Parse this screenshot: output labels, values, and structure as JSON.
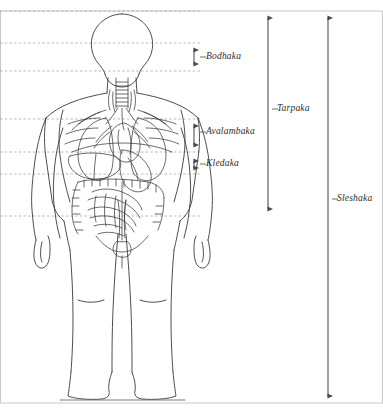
{
  "figure": {
    "colors": {
      "outline": "#3a3a3a",
      "guide_line": "#9a9a9a",
      "arrow": "#4a4a4a",
      "border": "#c8c8c8",
      "label_text": "#2b2b2b",
      "background": "#ffffff"
    }
  },
  "labels": {
    "bodhaka": "Bodhaka",
    "avalambaka": "Avalambaka",
    "kledaka": "Kledaka",
    "tarpaka": "Tarpaka",
    "sleshaka": "Sleshaka"
  },
  "measures": [
    {
      "name": "bodhaka",
      "label": "Bodhaka",
      "top": 43,
      "bottom": 71,
      "axis_x": 194
    },
    {
      "name": "avalambaka",
      "label": "Avalambaka",
      "top": 119,
      "bottom": 152,
      "axis_x": 194
    },
    {
      "name": "kledaka",
      "label": "Kledaka",
      "top": 155,
      "bottom": 174,
      "axis_x": 194
    },
    {
      "name": "tarpaka",
      "label": "Tarpaka",
      "top": 11,
      "bottom": 216,
      "axis_x": 268
    },
    {
      "name": "sleshaka",
      "label": "Sleshaka",
      "top": 11,
      "bottom": 403,
      "axis_x": 328
    }
  ],
  "guide_lines": [
    {
      "y": 11,
      "x_start": 0,
      "x_end": 200
    },
    {
      "y": 43,
      "x_start": 0,
      "x_end": 200
    },
    {
      "y": 71,
      "x_start": 0,
      "x_end": 200
    },
    {
      "y": 119,
      "x_start": 0,
      "x_end": 200
    },
    {
      "y": 152,
      "x_start": 0,
      "x_end": 200
    },
    {
      "y": 174,
      "x_start": 0,
      "x_end": 200
    },
    {
      "y": 216,
      "x_start": 0,
      "x_end": 200
    }
  ],
  "anatomy_parts": [
    "head",
    "neck",
    "trachea",
    "shoulders",
    "arms",
    "hands",
    "lungs",
    "heart",
    "aorta",
    "ribcage",
    "diaphragm",
    "liver",
    "stomach",
    "small-intestine",
    "large-intestine",
    "pelvis",
    "bladder",
    "legs",
    "feet"
  ]
}
